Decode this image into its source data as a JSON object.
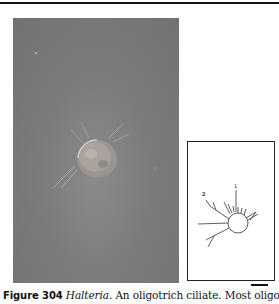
{
  "figure": {
    "label": "Figure 304",
    "genus": "Halteria",
    "caption_rest": ". An oligotrich ciliate. Most oligotrichs",
    "photo": {
      "subject": "Halteria ciliate cell, light micrograph",
      "background_color": "#7a7a7a"
    },
    "inset_diagram": {
      "labels": [
        "1",
        "2"
      ]
    },
    "scale_bar": {
      "present": true
    }
  }
}
